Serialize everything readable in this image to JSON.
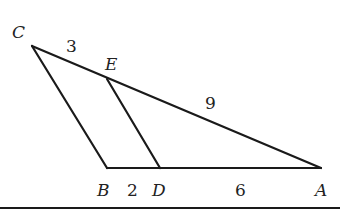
{
  "diagram": {
    "type": "triangle-with-parallel-segment",
    "points": [
      {
        "id": "C",
        "label": "C",
        "x": 32,
        "y": 46,
        "lx": 12,
        "ly": 38
      },
      {
        "id": "E",
        "label": "E",
        "x": 107,
        "y": 79,
        "lx": 105,
        "ly": 70
      },
      {
        "id": "B",
        "label": "B",
        "x": 107,
        "y": 168,
        "lx": 97,
        "ly": 196
      },
      {
        "id": "D",
        "label": "D",
        "x": 160,
        "y": 168,
        "lx": 152,
        "ly": 196
      },
      {
        "id": "A",
        "label": "A",
        "x": 321,
        "y": 168,
        "lx": 315,
        "ly": 196
      }
    ],
    "segments": [
      {
        "from": "C",
        "to": "A"
      },
      {
        "from": "C",
        "to": "B"
      },
      {
        "from": "B",
        "to": "A"
      },
      {
        "from": "E",
        "to": "D"
      }
    ],
    "lengths": [
      {
        "segment": "CE",
        "label": "3",
        "lx": 66,
        "ly": 52
      },
      {
        "segment": "EA",
        "label": "9",
        "lx": 205,
        "ly": 109
      },
      {
        "segment": "BD",
        "label": "2",
        "lx": 127,
        "ly": 196
      },
      {
        "segment": "DA",
        "label": "6",
        "lx": 235,
        "ly": 196
      }
    ]
  }
}
